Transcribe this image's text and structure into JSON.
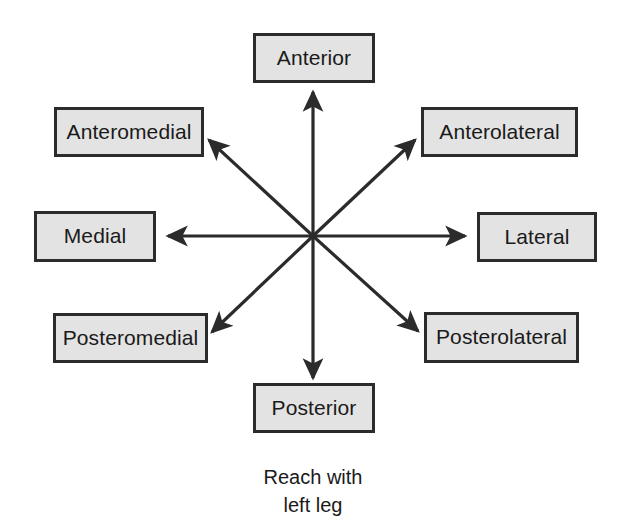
{
  "diagram": {
    "center": {
      "x": 313,
      "y": 236,
      "label": ""
    },
    "caption": {
      "line1": "Reach with",
      "line2": "left leg"
    },
    "colors": {
      "box_fill": "#e3e3e3",
      "box_border": "#2b2b2b",
      "arrow": "#2b2b2b",
      "text": "#1a1a1a",
      "background": "#ffffff"
    },
    "directions": [
      {
        "id": "anterior",
        "label": "Anterior",
        "angle_deg": 90,
        "compass": "N",
        "arrow": {
          "x1": 313,
          "y1": 236,
          "x2": 313,
          "y2": 92
        }
      },
      {
        "id": "anteromedial",
        "label": "Anteromedial",
        "angle_deg": 135,
        "compass": "NW",
        "arrow": {
          "x1": 313,
          "y1": 236,
          "x2": 209,
          "y2": 140
        }
      },
      {
        "id": "anterolateral",
        "label": "Anterolateral",
        "angle_deg": 45,
        "compass": "NE",
        "arrow": {
          "x1": 313,
          "y1": 236,
          "x2": 415,
          "y2": 140
        }
      },
      {
        "id": "medial",
        "label": "Medial",
        "angle_deg": 180,
        "compass": "W",
        "arrow": {
          "x1": 313,
          "y1": 236,
          "x2": 168,
          "y2": 236
        }
      },
      {
        "id": "lateral",
        "label": "Lateral",
        "angle_deg": 0,
        "compass": "E",
        "arrow": {
          "x1": 313,
          "y1": 236,
          "x2": 465,
          "y2": 236
        }
      },
      {
        "id": "posteromedial",
        "label": "Posteromedial",
        "angle_deg": 225,
        "compass": "SW",
        "arrow": {
          "x1": 313,
          "y1": 236,
          "x2": 212,
          "y2": 332
        }
      },
      {
        "id": "posterolateral",
        "label": "Posterolateral",
        "angle_deg": 315,
        "compass": "SE",
        "arrow": {
          "x1": 313,
          "y1": 236,
          "x2": 418,
          "y2": 331
        }
      },
      {
        "id": "posterior",
        "label": "Posterior",
        "angle_deg": 270,
        "compass": "S",
        "arrow": {
          "x1": 313,
          "y1": 236,
          "x2": 313,
          "y2": 378
        }
      }
    ]
  }
}
